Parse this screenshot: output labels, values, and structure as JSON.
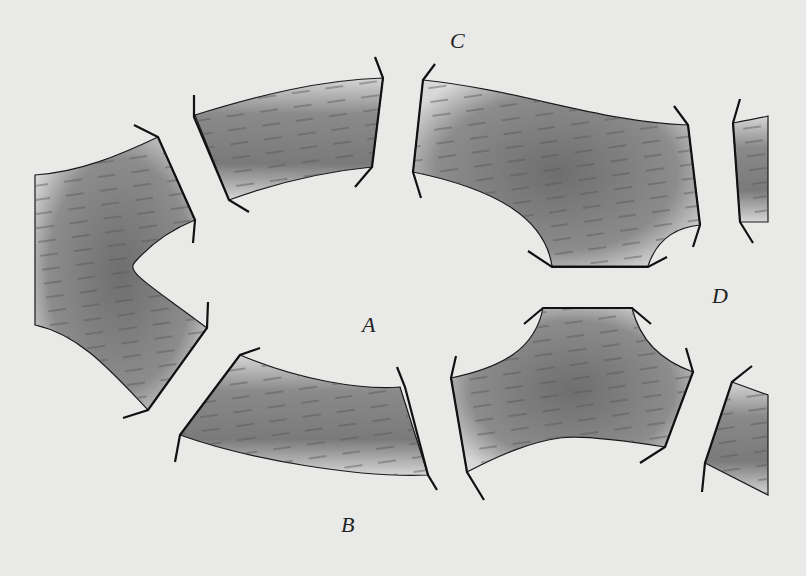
{
  "diagram": {
    "labels": {
      "A": {
        "text": "A",
        "x": 362,
        "y": 312
      },
      "B": {
        "text": "B",
        "x": 341,
        "y": 512
      },
      "C": {
        "text": "C",
        "x": 450,
        "y": 28
      },
      "D": {
        "text": "D",
        "x": 712,
        "y": 283
      }
    },
    "colors": {
      "background": "#e9e9e7",
      "band_dark": "#6e6e6e",
      "band_light": "#dcdcdc",
      "outline": "#1a1a1a",
      "dash": "#555555"
    },
    "segment_count": 8
  }
}
